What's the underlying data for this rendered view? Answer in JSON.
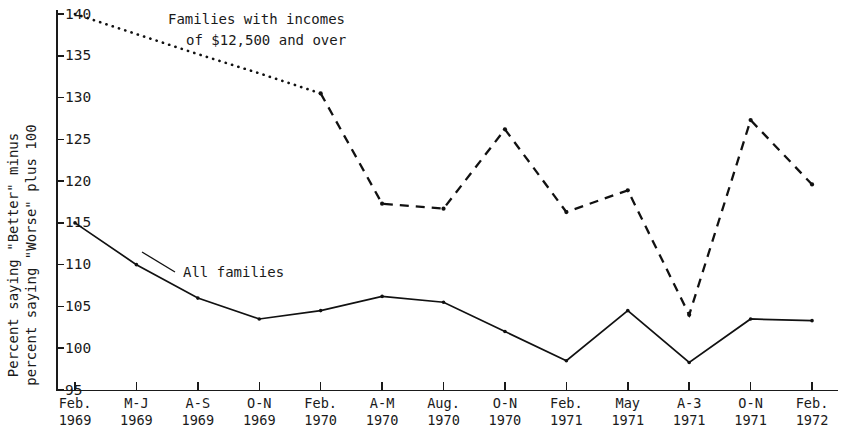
{
  "chart_data": {
    "type": "line",
    "title": "",
    "xlabel": "",
    "ylabel_line1": "Percent saying \"Better\" minus",
    "ylabel_line2": "percent saying \"Worse\" plus 100",
    "grid": false,
    "legend_position": "inline-annotation",
    "ylim": [
      95,
      140
    ],
    "yticks": [
      95,
      100,
      105,
      110,
      115,
      120,
      125,
      130,
      135,
      140
    ],
    "ytick_labels": [
      "95",
      "100",
      "105",
      "110",
      "115",
      "120",
      "125",
      "130",
      "135",
      "140"
    ],
    "categories": [
      "Feb.\n1969",
      "M-J\n1969",
      "A-S\n1969",
      "O-N\n1969",
      "Feb.\n1970",
      "A-M\n1970",
      "Aug.\n1970",
      "O-N\n1970",
      "Feb.\n1971",
      "May\n1971",
      "A-3\n1971",
      "O-N\n1971",
      "Feb.\n1972"
    ],
    "xtick_labels": [
      {
        "line1": "Feb.",
        "line2": "1969"
      },
      {
        "line1": "M-J",
        "line2": "1969"
      },
      {
        "line1": "A-S",
        "line2": "1969"
      },
      {
        "line1": "O-N",
        "line2": "1969"
      },
      {
        "line1": "Feb.",
        "line2": "1970"
      },
      {
        "line1": "A-M",
        "line2": "1970"
      },
      {
        "line1": "Aug.",
        "line2": "1970"
      },
      {
        "line1": "O-N",
        "line2": "1970"
      },
      {
        "line1": "Feb.",
        "line2": "1971"
      },
      {
        "line1": "May",
        "line2": "1971"
      },
      {
        "line1": "A-3",
        "line2": "1971"
      },
      {
        "line1": "O-N",
        "line2": "1971"
      },
      {
        "line1": "Feb.",
        "line2": "1972"
      }
    ],
    "series": [
      {
        "name": "Families with incomes of $12,500 and over",
        "style": "dotted-then-dashed",
        "dotted_through_index": 4,
        "values": [
          140.0,
          137.6,
          135.2,
          132.9,
          130.5,
          117.3,
          116.7,
          126.2,
          116.3,
          118.9,
          104.0,
          127.3,
          119.6
        ]
      },
      {
        "name": "All families",
        "style": "solid",
        "values": [
          115.0,
          110.0,
          106.0,
          103.5,
          104.5,
          106.2,
          105.5,
          102.0,
          98.5,
          104.5,
          98.3,
          103.5,
          103.3
        ]
      }
    ],
    "annotations": [
      {
        "id": "high-income-label",
        "line1": "Families with incomes",
        "line2": "of $12,500 and over",
        "x_px": 168,
        "y_px": 24
      },
      {
        "id": "all-families-label",
        "line1": "All families",
        "line2": "",
        "x_px": 183,
        "y_px": 277
      }
    ]
  },
  "colors": {
    "ink": "#111111",
    "background": "#ffffff"
  }
}
